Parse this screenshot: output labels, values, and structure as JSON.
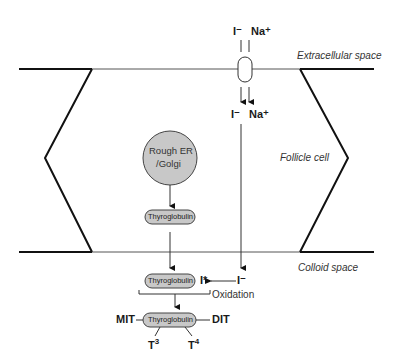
{
  "regions": {
    "extracellular": "Extracellular space",
    "follicle": "Follicle cell",
    "colloid": "Colloid space"
  },
  "ions": {
    "top_iodide": "I⁻",
    "top_sodium": "Na⁺",
    "mid_iodide": "I⁻",
    "mid_sodium": "Na⁺",
    "colloid_iodide": "I⁻",
    "iodine_oxidized": "I*"
  },
  "organelle": {
    "line1": "Rough ER",
    "line2": "/Golgi"
  },
  "proteins": {
    "thyroglobulin_cell": "Thyroglobulin",
    "thyroglobulin_colloid": "Thyroglobulin",
    "thyroglobulin_final": "Thyroglobulin"
  },
  "process": {
    "oxidation": "Oxidation"
  },
  "products": {
    "mit": "MIT",
    "dit": "DIT",
    "t3": "T",
    "t3_sup": "3",
    "t4": "T",
    "t4_sup": "4"
  },
  "colors": {
    "fill_gray": "#c8c8c8",
    "line": "#111111"
  }
}
